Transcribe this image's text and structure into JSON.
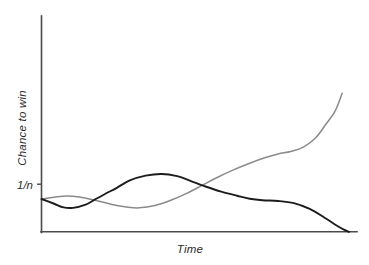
{
  "chart_data": {
    "type": "line",
    "title": "",
    "subtitle": "",
    "xlabel": "Time",
    "ylabel": "Chance to win",
    "grid": false,
    "legend": "none",
    "annotations": [],
    "xlim": [
      0,
      100
    ],
    "ylim": [
      0,
      100
    ],
    "x_ticks": [],
    "x_tick_labels": [],
    "y_ticks": [
      15.2
    ],
    "y_tick_labels": [
      "1/n"
    ],
    "reference_level": {
      "label": "1/n",
      "value": 15.2,
      "description": "baseline chance to win, equal to one over number of players"
    },
    "series": [
      {
        "name": "losing-player",
        "color": "#1c1c1c",
        "emphasis": "primary",
        "description": "starts at 1/n, wobbles above baseline mid-game, then decays to zero",
        "x": [
          0,
          4,
          7,
          10,
          14,
          17,
          20,
          24,
          28,
          33,
          38,
          43,
          47,
          52,
          57,
          62,
          66,
          70,
          75,
          80,
          85,
          90,
          93,
          96,
          97.5
        ],
        "y": [
          15.2,
          13.0,
          11.3,
          11.1,
          12.6,
          15.0,
          17.4,
          20.5,
          23.8,
          26.0,
          26.8,
          25.8,
          23.7,
          21.0,
          18.6,
          16.7,
          15.3,
          14.6,
          14.3,
          13.3,
          10.6,
          6.3,
          3.4,
          0.9,
          0.0
        ]
      },
      {
        "name": "winning-player",
        "color": "#8a8a8a",
        "emphasis": "secondary",
        "description": "starts at 1/n, small early bump, dips, then climbs steeply to a high chance to win",
        "x": [
          0,
          4,
          8,
          12,
          17,
          22,
          27,
          31,
          36,
          41,
          46,
          51,
          56,
          61,
          66,
          71,
          75,
          79,
          83,
          87,
          90,
          93,
          95.3
        ],
        "y": [
          15.2,
          16.0,
          16.6,
          16.1,
          14.6,
          12.8,
          11.5,
          11.1,
          12.2,
          14.6,
          17.8,
          21.6,
          25.4,
          28.8,
          31.8,
          34.4,
          36.1,
          37.2,
          39.2,
          43.7,
          49.6,
          55.8,
          64.2
        ]
      }
    ]
  },
  "axes": {
    "y_axis_name": "vertical-axis",
    "x_axis_name": "horizontal-axis"
  }
}
